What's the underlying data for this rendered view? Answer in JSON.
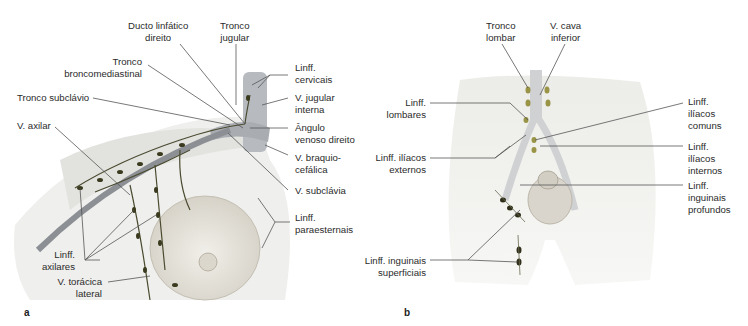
{
  "figure": {
    "panel_a": {
      "letter": "a",
      "labels": {
        "ducto": [
          "Ducto linfático",
          "direito"
        ],
        "tronco_jugular": [
          "Tronco",
          "jugular"
        ],
        "tronco_bronco": [
          "Tronco",
          "broncomediastinal"
        ],
        "tronco_subclavio": "Tronco subclávio",
        "v_axilar": "V. axilar",
        "linff_cervicais": [
          "Linff.",
          "cervicais"
        ],
        "v_jugular_interna": [
          "V. jugular",
          "interna"
        ],
        "angulo_venoso": [
          "Ângulo",
          "venoso direito"
        ],
        "v_braquio": [
          "V. braquio-",
          "cefálica"
        ],
        "v_subclavia": "V. subclávia",
        "linff_paraesternais": [
          "Linff.",
          "paraesternais"
        ],
        "linff_axilares": [
          "Linff.",
          "axilares"
        ],
        "v_toracica": [
          "V. torácica",
          "lateral"
        ]
      }
    },
    "panel_b": {
      "letter": "b",
      "labels": {
        "tronco_lombar": [
          "Tronco",
          "lombar"
        ],
        "v_cava": [
          "V. cava",
          "inferior"
        ],
        "linff_lombares": [
          "Linff.",
          "lombares"
        ],
        "linff_iliacos_externos": [
          "Linff. ilíacos",
          "externos"
        ],
        "linff_inguinais_superficiais": [
          "Linff. inguinais",
          "superficiais"
        ],
        "linff_iliacos_comuns": [
          "Linff.",
          "ilíacos",
          "comuns"
        ],
        "linff_iliacos_internos": [
          "Linff.",
          "ilíacos",
          "internos"
        ],
        "linff_inguinais_profundos": [
          "Linff.",
          "inguinais",
          "profundos"
        ]
      }
    },
    "colors": {
      "node_dark": "#3a3a1e",
      "node_olive": "#9a9446",
      "vessel": "#8f9499",
      "skin": "#e9e7e2",
      "leader": "#555555"
    }
  }
}
